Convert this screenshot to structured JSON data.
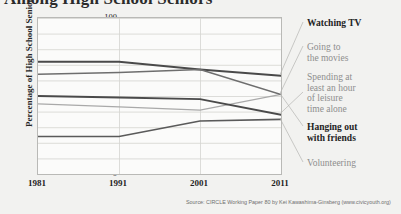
{
  "title": "Among High School Seniors",
  "source_note": "Source: CIRCLE Working Paper 80 by Kei Kawashima-Ginsberg (www.civicyouth.org)",
  "axes": {
    "ylabel": "Percentage of High School Seniors",
    "yticks": [
      "100",
      "90",
      "80",
      "70",
      "60",
      "50",
      "40",
      "30",
      "20",
      "10",
      "0"
    ],
    "xticks": [
      "1981",
      "1991",
      "2001",
      "2011"
    ]
  },
  "legend": [
    {
      "label": "Watching TV",
      "emphasis": "strong"
    },
    {
      "label": "Going to\nthe movies",
      "emphasis": "soft"
    },
    {
      "label": "Spending at\nleast an hour\nof leisure\ntime alone",
      "emphasis": "soft"
    },
    {
      "label": "Hanging out\nwith friends",
      "emphasis": "strong"
    },
    {
      "label": "Volunteering",
      "emphasis": "soft"
    }
  ],
  "chart_data": {
    "type": "line",
    "title": "Among High School Seniors",
    "xlabel": "",
    "ylabel": "Percentage of High School Seniors",
    "x": [
      1981,
      1991,
      2001,
      2011
    ],
    "xlim": [
      1981,
      2011
    ],
    "ylim": [
      0,
      100
    ],
    "ytick_step": 10,
    "grid": true,
    "legend_position": "right",
    "series": [
      {
        "name": "Watching TV",
        "values": [
          72,
          72,
          67,
          63
        ],
        "color": "#4a4a4a",
        "width": 1.9
      },
      {
        "name": "Going to the movies",
        "values": [
          45,
          43,
          41,
          51
        ],
        "color": "#a9a9a9",
        "width": 1.3
      },
      {
        "name": "Spending at least an hour of leisure time alone",
        "values": [
          50,
          49,
          48,
          38
        ],
        "color": "#4a4a4a",
        "width": 1.9
      },
      {
        "name": "Hanging out with friends",
        "values": [
          64,
          65,
          67,
          51
        ],
        "color": "#6e6e6e",
        "width": 1.5
      },
      {
        "name": "Volunteering",
        "values": [
          24,
          24,
          34,
          35
        ],
        "color": "#5a5a5a",
        "width": 1.6
      }
    ]
  },
  "colors": {
    "background": "#f2f2f0",
    "plot_background": "#fbfbfa",
    "plot_border": "#b9b9b6",
    "gridline": "#d4d4d1",
    "text_dark": "#232323",
    "text_soft": "#8e8e8e"
  }
}
